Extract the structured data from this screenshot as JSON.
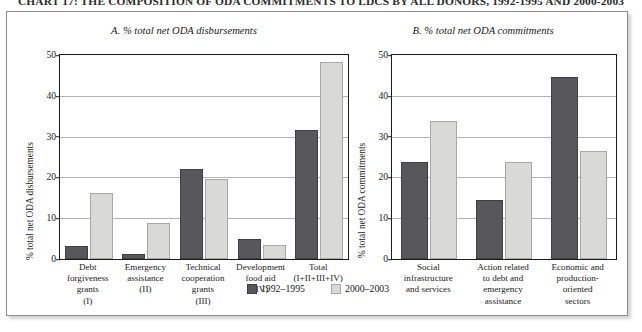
{
  "title": "CHART 17: THE COMPOSITION OF ODA COMMITMENTS TO LDCS BY ALL DONORS, 1992-1995 AND 2000-2003",
  "legend": {
    "items": [
      {
        "label": "1992–1995",
        "color": "#58585a",
        "swatch": "dark-square-swatch"
      },
      {
        "label": "2000–2003",
        "color": "#d9d9d7",
        "swatch": "light-square-swatch"
      }
    ]
  },
  "panels": [
    {
      "key": "a",
      "header": "A. % total net ODA disbursements"
    },
    {
      "key": "b",
      "header": "B. % total net ODA commitments"
    }
  ],
  "chart_data": [
    {
      "type": "bar",
      "title": "A. % total net ODA disbursements",
      "xlabel": "",
      "ylabel": "% total net ODA disbursements",
      "ylim": [
        0,
        50
      ],
      "yticks": [
        0,
        10,
        20,
        30,
        40,
        50
      ],
      "grid": true,
      "legend_position": "bottom-center",
      "categories": [
        "Debt forgiveness grants (I)",
        "Emergency assistance (II)",
        "Technical cooperation grants (III)",
        "Development food aid (IV)",
        "Total (I+II+III+IV)"
      ],
      "category_lines": [
        [
          "Debt",
          "forgiveness",
          "grants",
          "(I)"
        ],
        [
          "Emergency",
          "assistance",
          "(II)"
        ],
        [
          "Technical",
          "cooperation",
          "grants",
          "(III)"
        ],
        [
          "Development",
          "food aid",
          "(IV)"
        ],
        [
          "Total",
          "(I+II+III+IV)"
        ]
      ],
      "series": [
        {
          "name": "1992–1995",
          "color": "#58585a",
          "values": [
            3.2,
            1.2,
            22.0,
            5.0,
            31.5
          ]
        },
        {
          "name": "2000–2003",
          "color": "#d9d9d7",
          "values": [
            16.3,
            8.8,
            19.5,
            3.4,
            48.2
          ]
        }
      ]
    },
    {
      "type": "bar",
      "title": "B. % total net ODA commitments",
      "xlabel": "",
      "ylabel": "% total net ODA commitments",
      "ylim": [
        0,
        50
      ],
      "yticks": [
        0,
        10,
        20,
        30,
        40,
        50
      ],
      "grid": true,
      "legend_position": "bottom-center",
      "categories": [
        "Social infrastructure and services",
        "Action related to debt and emergency assistance",
        "Economic and production-oriented sectors"
      ],
      "category_lines": [
        [
          "Social",
          "infrastructure",
          "and services"
        ],
        [
          "Action related",
          "to debt and",
          "emergency",
          "assistance"
        ],
        [
          "Economic and",
          "production-",
          "oriented",
          "sectors"
        ]
      ],
      "series": [
        {
          "name": "1992–1995",
          "color": "#58585a",
          "values": [
            23.8,
            14.4,
            44.6
          ]
        },
        {
          "name": "2000–2003",
          "color": "#d9d9d7",
          "values": [
            33.8,
            23.9,
            26.4
          ]
        }
      ]
    }
  ]
}
